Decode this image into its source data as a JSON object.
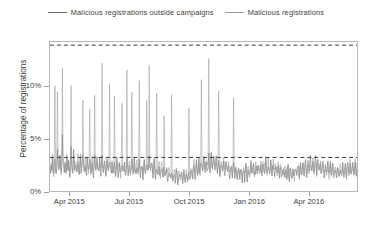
{
  "chart_data": {
    "type": "line",
    "title": "",
    "subtitle": "",
    "xlabel": "",
    "ylabel": "Percentage of registrations",
    "xlim": [
      "2015-03-01",
      "2016-06-15"
    ],
    "ylim": [
      0,
      14.2
    ],
    "grid": false,
    "legend_position": "top-center",
    "y_ticks": [
      {
        "value": 0,
        "label": "0%"
      },
      {
        "value": 5,
        "label": "5%"
      },
      {
        "value": 10,
        "label": "10%"
      }
    ],
    "x_ticks": [
      {
        "value": "2015-04-01",
        "label": "Apr 2015"
      },
      {
        "value": "2015-07-01",
        "label": "Jul 2015"
      },
      {
        "value": "2015-10-01",
        "label": "Oct 2015"
      },
      {
        "value": "2016-01-01",
        "label": "Jan 2016"
      },
      {
        "value": "2016-04-01",
        "label": "Apr 2016"
      }
    ],
    "reference_lines": [
      {
        "name": "upper-threshold",
        "value": 13.9,
        "style": "dashed",
        "color": "#3a3a3a"
      },
      {
        "name": "lower-threshold",
        "value": 3.2,
        "style": "dashed",
        "color": "#3a3a3a"
      }
    ],
    "series": [
      {
        "name": "Malicious registrations outside campaigns",
        "color": "#6e6e6e",
        "values": [
          2.2,
          1.7,
          2.4,
          1.9,
          3.0,
          2.1,
          1.6,
          2.6,
          3.4,
          2.0,
          1.5,
          2.3,
          4.1,
          2.8,
          1.9,
          2.2,
          3.1,
          2.0,
          1.6,
          2.5,
          5.2,
          3.0,
          2.1,
          1.8,
          2.7,
          2.2,
          1.7,
          3.3,
          2.4,
          1.9,
          2.6,
          2.0,
          1.5,
          2.8,
          4.4,
          2.3,
          1.8,
          2.1,
          3.6,
          2.5,
          1.9,
          2.2,
          2.8,
          2.0,
          1.6,
          3.1,
          2.4,
          1.8,
          2.2,
          2.9,
          2.1,
          1.7,
          2.5,
          3.8,
          2.3,
          1.9,
          2.0,
          2.6,
          2.2,
          1.6,
          2.9,
          2.4,
          1.8,
          2.1,
          3.3,
          2.5,
          1.9,
          2.2,
          2.7,
          2.0,
          1.5,
          2.4,
          3.1,
          2.2,
          1.8,
          2.6,
          2.9,
          2.1,
          1.7,
          2.3,
          2.8,
          2.0,
          1.6,
          2.5,
          3.4,
          2.2,
          1.9,
          2.1,
          2.6,
          2.0,
          1.5,
          2.3,
          2.9,
          2.1,
          1.7,
          2.4,
          3.0,
          2.2,
          1.8,
          2.0,
          2.5,
          1.9,
          1.4,
          2.2,
          2.7,
          2.0,
          1.6,
          2.3,
          2.8,
          2.1,
          1.7,
          2.0,
          2.4,
          1.8,
          1.4,
          2.1,
          2.6,
          1.9,
          1.5,
          2.2,
          2.7,
          2.0,
          1.6,
          2.3,
          3.1,
          2.2,
          1.8,
          2.0,
          2.5,
          1.9,
          1.5,
          2.2,
          2.8,
          2.1,
          1.7,
          2.4,
          3.0,
          2.2,
          1.8,
          2.1,
          2.6,
          2.0,
          1.6,
          2.3,
          2.9,
          2.1,
          1.7,
          2.0,
          2.5,
          1.9,
          1.5,
          2.2,
          2.7,
          2.0,
          1.6,
          2.3,
          2.8,
          2.1,
          1.7,
          2.4,
          3.2,
          2.3,
          1.9,
          2.1,
          2.6,
          2.0,
          1.6,
          2.2,
          2.7,
          2.0,
          1.5,
          2.1,
          2.5,
          1.9,
          1.4,
          2.0,
          2.4,
          1.8,
          1.4,
          2.0,
          2.3,
          1.8,
          1.3,
          1.9,
          2.2,
          1.7,
          1.3,
          1.8,
          2.1,
          1.6,
          1.2,
          1.7,
          2.0,
          1.5,
          1.2,
          1.6,
          1.9,
          1.5,
          1.1,
          1.5,
          1.8,
          1.4,
          1.1,
          1.5,
          1.7,
          1.3,
          1.0,
          1.4,
          1.6,
          1.3,
          1.0,
          1.3,
          1.5,
          1.2,
          0.9,
          1.3,
          1.6,
          1.3,
          1.0,
          1.4,
          1.8,
          1.4,
          1.1,
          1.5,
          2.0,
          1.6,
          1.2,
          1.7,
          2.2,
          1.7,
          1.3,
          1.8,
          2.4,
          1.9,
          1.4,
          2.0,
          2.6,
          2.0,
          1.6,
          2.2,
          2.8,
          2.1,
          1.7,
          2.3,
          2.9,
          2.2,
          1.8,
          2.4,
          3.0,
          2.3,
          1.8,
          2.5,
          3.1,
          2.3,
          1.9,
          2.5,
          3.2,
          2.4,
          1.9,
          2.6,
          3.3,
          2.4,
          2.0,
          2.6,
          3.1,
          2.3,
          1.9,
          2.5,
          3.0,
          2.2,
          1.8,
          2.4,
          2.9,
          2.2,
          1.7,
          2.3,
          2.8,
          2.1,
          1.7,
          2.2,
          2.7,
          2.0,
          1.6,
          2.1,
          2.6,
          2.0,
          1.5,
          2.1,
          2.5,
          1.9,
          1.5,
          2.0,
          2.4,
          1.8,
          1.4,
          1.9,
          2.3,
          1.8,
          1.4,
          1.9,
          2.2,
          1.7,
          1.3,
          1.8,
          2.1,
          1.6,
          1.3,
          1.7,
          2.0,
          1.6,
          1.2,
          1.7,
          2.1,
          1.6,
          1.2,
          1.7,
          2.2,
          1.7,
          1.3,
          1.8,
          2.3,
          1.8,
          1.4,
          1.9,
          2.4,
          1.9,
          1.5,
          2.0,
          2.5,
          1.9,
          1.5,
          2.0,
          2.6,
          2.0,
          1.6,
          2.1,
          2.7,
          2.0,
          1.6,
          2.2,
          2.8,
          2.1,
          1.7,
          2.3,
          2.9,
          2.2,
          1.7,
          2.3,
          2.8,
          2.1,
          1.7,
          2.2,
          2.7,
          2.0,
          1.6,
          2.2,
          2.6,
          2.0,
          1.6,
          2.1,
          2.5,
          1.9,
          1.5,
          2.0,
          2.4,
          1.8,
          1.4,
          1.9,
          2.3,
          1.8,
          1.4,
          1.9,
          2.2,
          1.7,
          1.3,
          1.8,
          2.1,
          1.6,
          1.3,
          1.7,
          2.0,
          1.6,
          1.2,
          1.7,
          2.1,
          1.6,
          1.3,
          1.8,
          2.2,
          1.7,
          1.3,
          1.8,
          2.3,
          1.8,
          1.4,
          1.9,
          2.4,
          1.8,
          1.5,
          2.0,
          2.5,
          1.9,
          1.5,
          2.0,
          2.6,
          2.0,
          1.6,
          2.1,
          2.7,
          2.0,
          1.6,
          2.2,
          2.8,
          2.1,
          1.7,
          2.2,
          2.9,
          2.2,
          1.7,
          2.3,
          3.0,
          2.2,
          1.8,
          2.4,
          3.1,
          2.3,
          1.8,
          2.4,
          3.0,
          2.3,
          1.8,
          2.4,
          2.9,
          2.2,
          1.7,
          2.3,
          2.8,
          2.1,
          1.7,
          2.2,
          2.7,
          2.0,
          1.6,
          2.1,
          2.6,
          2.0,
          1.6,
          2.1,
          2.5,
          1.9,
          1.5,
          2.0,
          2.4,
          1.9,
          1.5,
          2.0,
          2.3,
          1.8,
          1.4,
          1.9,
          2.2,
          1.7,
          1.4,
          1.8,
          2.1,
          1.7,
          1.3,
          1.8,
          2.2,
          1.7,
          1.3,
          1.8,
          2.3,
          1.8,
          1.4,
          1.9,
          2.4,
          1.8,
          1.5,
          2.0,
          2.5,
          1.9,
          1.5,
          2.0,
          2.6,
          2.0,
          1.6,
          2.1,
          2.7,
          2.1,
          1.6,
          2.2,
          2.8,
          2.1,
          1.7,
          2.3
        ]
      },
      {
        "name": "Malicious registrations",
        "color": "#9a9a9a",
        "values": [
          2.4,
          1.9,
          2.6,
          2.1,
          3.3,
          2.3,
          1.8,
          2.9,
          10.2,
          2.3,
          1.7,
          2.6,
          9.1,
          3.1,
          2.1,
          2.4,
          3.4,
          2.2,
          1.8,
          2.8,
          11.4,
          3.3,
          2.3,
          2.0,
          3.0,
          2.4,
          1.9,
          3.7,
          2.7,
          2.1,
          2.9,
          2.2,
          1.7,
          3.1,
          9.8,
          2.6,
          2.0,
          2.3,
          4.0,
          2.8,
          2.1,
          2.4,
          3.1,
          2.2,
          1.8,
          3.4,
          2.7,
          2.0,
          2.4,
          3.2,
          2.3,
          1.9,
          2.8,
          8.7,
          2.6,
          2.1,
          2.2,
          2.9,
          2.4,
          1.8,
          3.2,
          2.7,
          2.0,
          2.3,
          7.6,
          2.8,
          2.1,
          2.4,
          3.0,
          2.2,
          1.7,
          2.7,
          9.4,
          2.4,
          2.0,
          2.9,
          3.2,
          2.3,
          1.9,
          2.6,
          3.1,
          2.2,
          1.8,
          2.8,
          11.8,
          2.4,
          2.1,
          2.3,
          2.9,
          2.2,
          1.7,
          2.6,
          3.2,
          2.3,
          1.9,
          2.7,
          10.6,
          2.4,
          2.0,
          2.2,
          2.8,
          2.1,
          1.6,
          2.4,
          9.2,
          2.2,
          1.8,
          2.6,
          3.1,
          2.3,
          1.9,
          2.2,
          2.7,
          2.0,
          1.6,
          2.3,
          8.4,
          2.1,
          1.7,
          2.4,
          3.0,
          2.2,
          1.8,
          2.6,
          11.2,
          2.4,
          2.0,
          2.2,
          2.8,
          2.1,
          1.7,
          2.4,
          9.6,
          2.3,
          1.9,
          2.7,
          3.3,
          2.4,
          2.0,
          2.3,
          2.9,
          2.2,
          1.8,
          2.6,
          10.1,
          2.3,
          1.9,
          2.2,
          2.8,
          2.1,
          1.7,
          2.4,
          3.0,
          2.2,
          1.8,
          2.6,
          8.9,
          2.3,
          1.9,
          2.7,
          11.6,
          2.5,
          2.1,
          2.3,
          2.9,
          2.2,
          1.8,
          2.4,
          3.0,
          2.2,
          1.7,
          2.3,
          9.7,
          2.1,
          1.6,
          2.2,
          2.6,
          2.0,
          1.6,
          2.2,
          2.5,
          2.0,
          1.5,
          2.1,
          7.3,
          1.9,
          1.5,
          2.0,
          2.3,
          1.8,
          1.4,
          1.9,
          2.2,
          1.7,
          1.4,
          1.8,
          9.1,
          1.7,
          1.3,
          1.7,
          2.0,
          1.6,
          1.3,
          1.7,
          1.9,
          1.5,
          1.2,
          1.6,
          1.8,
          1.5,
          1.2,
          1.5,
          1.7,
          1.4,
          1.1,
          1.5,
          1.8,
          1.5,
          1.2,
          1.6,
          2.0,
          1.6,
          1.3,
          1.7,
          8.2,
          1.8,
          1.4,
          1.9,
          2.4,
          1.9,
          1.5,
          2.0,
          2.6,
          2.1,
          1.6,
          2.2,
          2.8,
          2.2,
          1.8,
          2.4,
          3.0,
          2.3,
          1.9,
          2.5,
          10.4,
          2.4,
          2.0,
          2.6,
          3.2,
          2.5,
          2.0,
          2.7,
          3.3,
          2.5,
          2.1,
          2.7,
          12.8,
          2.6,
          2.1,
          2.8,
          3.5,
          2.6,
          2.2,
          2.8,
          3.3,
          2.5,
          2.1,
          2.7,
          3.2,
          2.4,
          2.0,
          2.6,
          9.3,
          2.4,
          1.9,
          2.5,
          3.0,
          2.3,
          1.9,
          2.4,
          2.9,
          2.2,
          1.8,
          2.3,
          2.8,
          2.2,
          1.7,
          2.3,
          2.7,
          2.1,
          1.7,
          2.2,
          2.6,
          2.0,
          1.6,
          2.1,
          8.6,
          2.0,
          1.6,
          2.1,
          2.4,
          1.9,
          1.5,
          2.0,
          2.3,
          1.8,
          1.5,
          1.9,
          2.2,
          1.8,
          1.4,
          1.9,
          2.3,
          1.8,
          1.4,
          1.9,
          2.4,
          1.9,
          1.5,
          2.0,
          2.5,
          2.0,
          1.6,
          2.1,
          2.6,
          2.1,
          1.7,
          2.2,
          2.7,
          2.1,
          1.7,
          2.2,
          2.8,
          2.2,
          1.8,
          2.3,
          2.9,
          2.2,
          1.8,
          2.4,
          3.0,
          2.3,
          1.9,
          2.5,
          3.1,
          2.4,
          1.9,
          2.5,
          3.0,
          2.3,
          1.9,
          2.4,
          2.9,
          2.2,
          1.8,
          2.4,
          2.8,
          2.2,
          1.8,
          2.3,
          2.7,
          2.1,
          1.7,
          2.2,
          2.6,
          2.1,
          1.6,
          2.2,
          2.5,
          2.0,
          1.6,
          2.1,
          2.4,
          1.9,
          1.5,
          2.0,
          2.3,
          1.9,
          1.5,
          2.0,
          2.2,
          1.8,
          1.4,
          1.9,
          2.1,
          1.7,
          1.4,
          1.8,
          2.0,
          1.7,
          1.3,
          1.8,
          2.1,
          1.7,
          1.3,
          1.8,
          2.2,
          1.8,
          1.4,
          1.9,
          2.3,
          1.9,
          1.5,
          2.0,
          2.4,
          1.9,
          1.5,
          2.0,
          2.5,
          2.0,
          1.6,
          2.1,
          2.6,
          2.0,
          1.6,
          2.1,
          2.7,
          2.1,
          1.7,
          2.2,
          2.8,
          2.2,
          1.8,
          2.3,
          2.9,
          2.2,
          1.8,
          2.3,
          2.8,
          2.2,
          1.8,
          2.3,
          2.7,
          2.1,
          1.7,
          2.2,
          2.6,
          2.0,
          1.6,
          2.1,
          2.5,
          2.0,
          1.6,
          2.1,
          2.4,
          1.9,
          1.5,
          2.0,
          2.3,
          1.9,
          1.5,
          2.0,
          2.2,
          1.8,
          1.4,
          1.9,
          2.1,
          1.7,
          1.4,
          1.8,
          2.0,
          1.7,
          1.3,
          1.8,
          2.1,
          1.7,
          1.3,
          1.8,
          2.2,
          1.8,
          1.4,
          1.9,
          2.3,
          1.8,
          1.4,
          1.9,
          2.4,
          1.9,
          1.5,
          2.0,
          2.5,
          2.0,
          1.6,
          2.1,
          2.6,
          2.0,
          1.6,
          2.1,
          2.7,
          2.1,
          1.7,
          2.2,
          2.8,
          2.2,
          1.8,
          2.3
        ]
      }
    ]
  },
  "legend": {
    "entries": [
      {
        "label": "Malicious registrations outside campaigns",
        "color": "#6e6e6e"
      },
      {
        "label": "Malicious registrations",
        "color": "#9a9a9a"
      }
    ]
  }
}
